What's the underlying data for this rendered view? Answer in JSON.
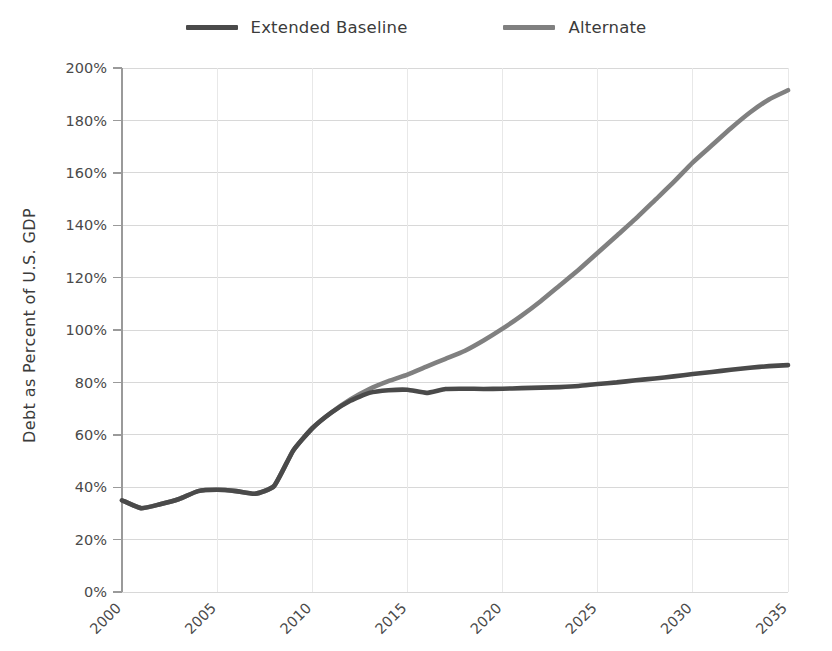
{
  "chart_data": {
    "type": "line",
    "title": "",
    "subtitle": "",
    "xlabel": "",
    "ylabel": "Debt as Percent of U.S. GDP",
    "xlim": [
      2000,
      2035
    ],
    "ylim": [
      0,
      200
    ],
    "grid": true,
    "legend_position": "top-center",
    "y_tick_labels": [
      "200%",
      "180%",
      "160%",
      "140%",
      "120%",
      "100%",
      "80%",
      "60%",
      "40%",
      "20%",
      "0%"
    ],
    "y_tick_values": [
      200,
      180,
      160,
      140,
      120,
      100,
      80,
      60,
      40,
      20,
      0
    ],
    "x_tick_labels": [
      "2000",
      "2005",
      "2010",
      "2015",
      "2020",
      "2025",
      "2030",
      "2035"
    ],
    "x_tick_values": [
      2000,
      2005,
      2010,
      2015,
      2020,
      2025,
      2030,
      2035
    ],
    "x": [
      2000,
      2001,
      2002,
      2003,
      2004,
      2005,
      2006,
      2007,
      2008,
      2009,
      2010,
      2011,
      2012,
      2013,
      2014,
      2015,
      2016,
      2017,
      2018,
      2019,
      2020,
      2021,
      2022,
      2023,
      2024,
      2025,
      2026,
      2027,
      2028,
      2029,
      2030,
      2031,
      2032,
      2033,
      2034,
      2035
    ],
    "series": [
      {
        "name": "Extended Baseline",
        "color": "#4a4a4a",
        "values": [
          35.0,
          32.0,
          33.5,
          35.5,
          38.5,
          39.0,
          38.5,
          37.5,
          40.5,
          54.0,
          62.5,
          68.5,
          73.0,
          76.0,
          77.0,
          77.2,
          76.0,
          77.5,
          77.6,
          77.5,
          77.6,
          77.8,
          78.0,
          78.2,
          78.6,
          79.4,
          80.0,
          80.8,
          81.5,
          82.3,
          83.2,
          84.0,
          84.8,
          85.6,
          86.2,
          86.6
        ]
      },
      {
        "name": "Alternate",
        "color": "#808080",
        "values": [
          35.0,
          32.0,
          33.5,
          35.5,
          38.5,
          39.0,
          38.5,
          37.5,
          40.5,
          54.0,
          62.5,
          68.5,
          73.5,
          77.5,
          80.5,
          83.0,
          86.0,
          89.0,
          92.0,
          96.0,
          100.5,
          105.5,
          111.0,
          117.0,
          123.0,
          129.5,
          136.0,
          142.5,
          149.5,
          156.5,
          164.0,
          170.5,
          177.0,
          183.0,
          188.0,
          191.5
        ]
      }
    ]
  },
  "legend": {
    "items": [
      {
        "label": "Extended Baseline",
        "color": "#4a4a4a"
      },
      {
        "label": "Alternate",
        "color": "#808080"
      }
    ]
  }
}
